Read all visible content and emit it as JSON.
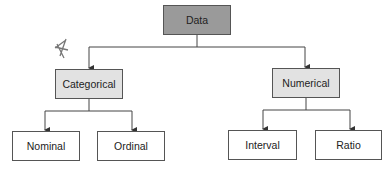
{
  "diagram": {
    "root": {
      "label": "Data"
    },
    "categories": [
      {
        "label": "Categorical",
        "children": [
          {
            "label": "Nominal"
          },
          {
            "label": "Ordinal"
          }
        ]
      },
      {
        "label": "Numerical",
        "children": [
          {
            "label": "Interval"
          },
          {
            "label": "Ratio"
          }
        ]
      }
    ]
  },
  "colors": {
    "root_fill": "#9a9a9a",
    "mid_fill": "#e2e2e2",
    "leaf_fill": "#ffffff",
    "border": "#555555"
  }
}
